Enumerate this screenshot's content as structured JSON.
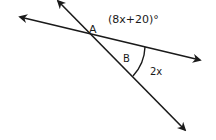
{
  "diagram": {
    "type": "intersecting-lines-angle-problem",
    "colors": {
      "background": "#ffffff",
      "stroke": "#1a1a1a"
    },
    "lines": [
      {
        "name": "line-1",
        "from": [
          20,
          17
        ],
        "to": [
          200,
          60
        ],
        "arrow_start": true,
        "arrow_end": true
      },
      {
        "name": "line-2",
        "from": [
          58,
          1
        ],
        "to": [
          185,
          130
        ],
        "arrow_start": true,
        "arrow_end": true
      }
    ],
    "intersection": [
      92,
      35
    ],
    "labels": {
      "point_a": "A",
      "angle_b": "B",
      "angle_top": "(8x+20)°",
      "angle_right": "2x"
    },
    "angle_arc": {
      "start": [
        145,
        47
      ],
      "end": [
        133,
        76
      ],
      "radius": 45
    }
  }
}
